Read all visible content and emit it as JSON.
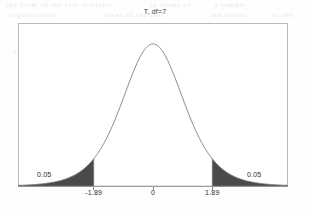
{
  "figure": {
    "title": "T, df=7",
    "background_color": "#fefefe",
    "frame_color": "#b9b9b9",
    "curve_color": "#7a7a7a",
    "shade_color": "#4a4a4a"
  },
  "labels": {
    "tail_left": "0.05",
    "tail_right": "0.05",
    "tick_neg": "-1.89",
    "tick_mid": "0",
    "tick_pos": "1.89"
  },
  "artifacts": [
    {
      "text": "the form of the test statistic",
      "x": 6,
      "y": 1
    },
    {
      "text": "in terms of",
      "x": 150,
      "y": 1
    },
    {
      "text": "a sample",
      "x": 214,
      "y": 1
    },
    {
      "text": "significance",
      "x": 10,
      "y": 11
    },
    {
      "text": "level of the test",
      "x": 104,
      "y": 11
    },
    {
      "text": "we reject",
      "x": 212,
      "y": 11
    },
    {
      "text": "at the",
      "x": 272,
      "y": 11
    },
    {
      "text": "population mean",
      "x": 90,
      "y": 28
    },
    {
      "text": "is not equal to",
      "x": 186,
      "y": 28
    },
    {
      "text": "the critical",
      "x": 14,
      "y": 48
    },
    {
      "text": "values for a two",
      "x": 88,
      "y": 48
    },
    {
      "text": "tailed test",
      "x": 196,
      "y": 48
    },
    {
      "text": "with",
      "x": 268,
      "y": 48
    },
    {
      "text": "degrees of freedom",
      "x": 120,
      "y": 74
    },
    {
      "text": "the area in each",
      "x": 24,
      "y": 98
    },
    {
      "text": "tail is",
      "x": 134,
      "y": 98
    },
    {
      "text": "equal to",
      "x": 192,
      "y": 98
    },
    {
      "text": "0.05 so that",
      "x": 62,
      "y": 122
    },
    {
      "text": "the total",
      "x": 168,
      "y": 122
    },
    {
      "text": "rejection region",
      "x": 226,
      "y": 122
    },
    {
      "text": "has probability",
      "x": 30,
      "y": 146
    },
    {
      "text": "0.10 under",
      "x": 150,
      "y": 146
    },
    {
      "text": "the null",
      "x": 232,
      "y": 146
    }
  ],
  "chart_data": {
    "type": "line",
    "title": "T, df=7",
    "xlabel": "",
    "ylabel": "",
    "distribution": "Student t",
    "df": 7,
    "xlim": [
      -4.3,
      4.3
    ],
    "ylim": [
      0,
      0.42
    ],
    "grid": false,
    "legend": null,
    "xticks": [
      -1.89,
      0,
      1.89
    ],
    "xticklabels": [
      "-1.89",
      "0",
      "1.89"
    ],
    "critical_values": [
      -1.89,
      1.89
    ],
    "shaded_regions": [
      {
        "from": -4.3,
        "to": -1.89,
        "area": 0.05,
        "label": "0.05",
        "color": "#4a4a4a"
      },
      {
        "from": 1.89,
        "to": 4.3,
        "area": 0.05,
        "label": "0.05",
        "color": "#4a4a4a"
      }
    ],
    "x": [
      -4.3,
      -4.0,
      -3.6,
      -3.2,
      -2.8,
      -2.4,
      -2.0,
      -1.89,
      -1.6,
      -1.2,
      -0.8,
      -0.4,
      0.0,
      0.4,
      0.8,
      1.2,
      1.6,
      1.89,
      2.0,
      2.4,
      2.8,
      3.2,
      3.6,
      4.0,
      4.3
    ],
    "y": [
      0.004,
      0.006,
      0.01,
      0.017,
      0.029,
      0.049,
      0.08,
      0.093,
      0.127,
      0.191,
      0.263,
      0.333,
      0.385,
      0.333,
      0.263,
      0.191,
      0.127,
      0.093,
      0.08,
      0.049,
      0.029,
      0.017,
      0.01,
      0.006,
      0.004
    ]
  }
}
